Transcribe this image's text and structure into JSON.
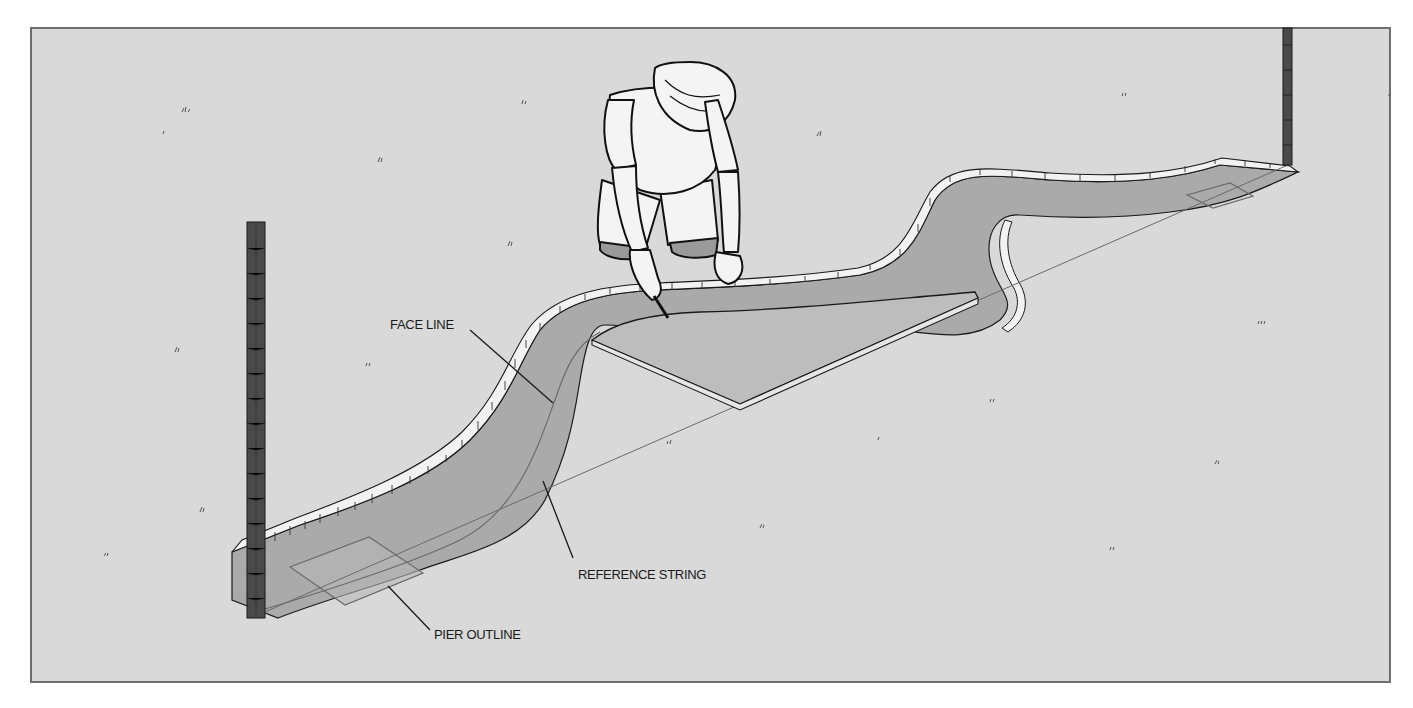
{
  "figure": {
    "colors": {
      "background": "#d9d9d9",
      "frame": "#6e6e6e",
      "trench_floor": "#a9a9a9",
      "trench_floor_far": "#b3b3b3",
      "spoil_edge": "#f2f2f2",
      "stake": "#4a4a4a",
      "template_board": "#bdbdbd",
      "line": "#1a1a1a",
      "string": "#707070"
    },
    "labels": {
      "face_line": "FACE LINE",
      "reference_string": "REFERENCE STRING",
      "pier_outline": "PIER OUTLINE"
    }
  }
}
